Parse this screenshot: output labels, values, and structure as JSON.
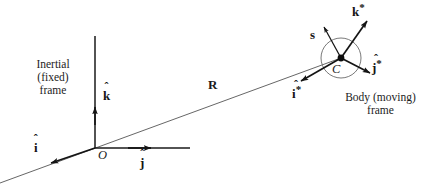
{
  "figure": {
    "type": "vector-diagram",
    "background_color": "#ffffff",
    "stroke_color": "#1a1a1a",
    "width": 431,
    "height": 192
  },
  "frames": {
    "inertial": {
      "caption_lines": [
        "Inertial",
        "(fixed)",
        "frame"
      ],
      "origin_label": "O",
      "origin_point": [
        95,
        148
      ],
      "axes": [
        {
          "name": "k-hat",
          "letter": "k",
          "hat": true,
          "star": false,
          "label": "k̂",
          "direction": "up",
          "tip": [
            95,
            108
          ]
        },
        {
          "name": "j-hat",
          "letter": "j",
          "hat": true,
          "star": false,
          "label": "ĵ",
          "direction": "right",
          "tip": [
            152,
            148
          ]
        },
        {
          "name": "i-hat",
          "letter": "i",
          "hat": true,
          "star": false,
          "label": "î",
          "direction": "down-left",
          "tip": [
            50,
            163
          ]
        }
      ]
    },
    "body": {
      "caption_lines": [
        "Body (moving)",
        "frame"
      ],
      "center_label": "C",
      "center_point": [
        341,
        58
      ],
      "circle_radius": 20,
      "axes": [
        {
          "name": "k-hat-star",
          "letter": "k",
          "hat": true,
          "star": true,
          "label": "k̂*",
          "direction": "up-right",
          "tip": [
            368,
            20
          ]
        },
        {
          "name": "j-hat-star",
          "letter": "j",
          "hat": true,
          "star": true,
          "label": "ĵ*",
          "direction": "down-right",
          "tip": [
            371,
            74
          ]
        },
        {
          "name": "i-hat-star",
          "letter": "i",
          "hat": true,
          "star": true,
          "label": "î*",
          "direction": "down-left",
          "tip": [
            300,
            82
          ]
        }
      ],
      "spin_vector": {
        "name": "s",
        "label": "s",
        "direction": "up-left",
        "tip": [
          323,
          26
        ]
      }
    }
  },
  "position_vector": {
    "name": "R",
    "label": "R",
    "from": [
      95,
      148
    ],
    "to": [
      341,
      58
    ],
    "extends_to": [
      0,
      183
    ],
    "description": "position vector from inertial origin O to body center C"
  },
  "glyphs": {
    "letter_i": "i",
    "letter_j": "j",
    "letter_k": "k",
    "hat": "ˆ",
    "star": "*"
  }
}
